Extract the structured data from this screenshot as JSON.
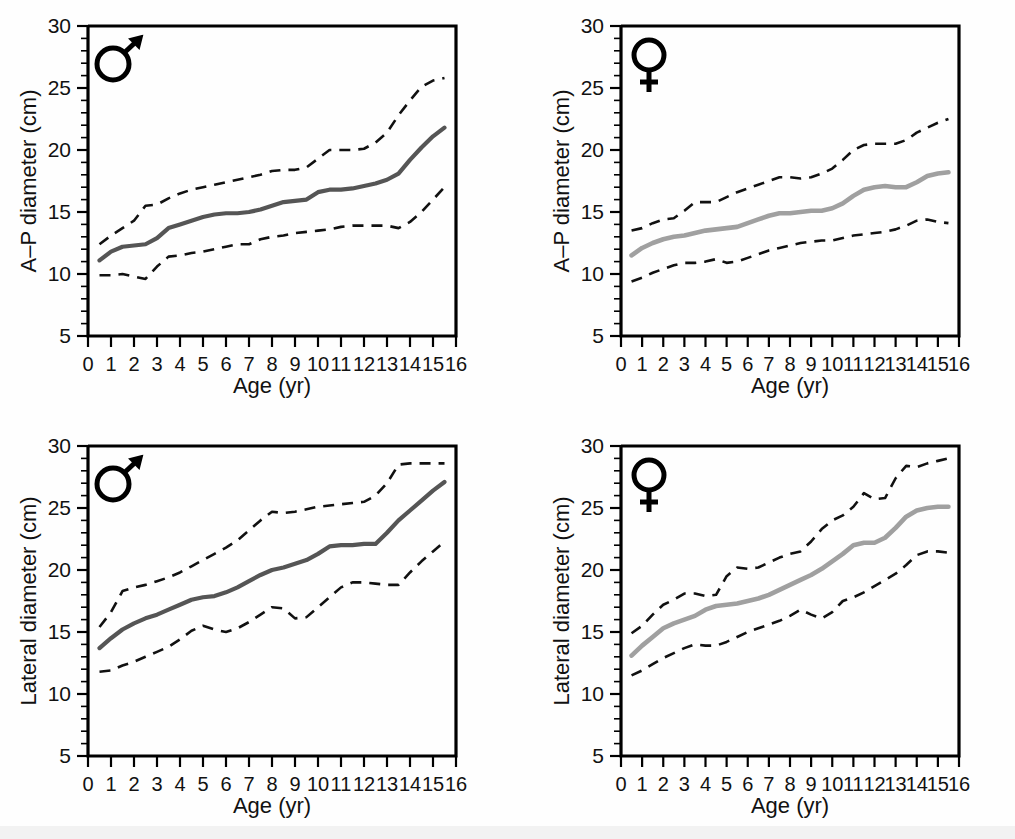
{
  "figure": {
    "name": "chest-diameter-growth-curves",
    "background": "#ffffff"
  },
  "axis": {
    "x_title": "Age (yr)",
    "x_ticks": [
      "0",
      "1",
      "2",
      "3",
      "4",
      "5",
      "6",
      "7",
      "8",
      "9",
      "10",
      "11",
      "12",
      "13",
      "14",
      "15",
      "16"
    ],
    "y_ticks": [
      "5",
      "10",
      "15",
      "20",
      "25",
      "30"
    ],
    "y_title_ap": "A–P diameter (cm)",
    "y_title_lateral": "Lateral diameter (cm)",
    "xlim": [
      0,
      16
    ],
    "ylim": [
      5,
      30
    ],
    "x_minor_step": 1,
    "y_major_step": 5,
    "y_minor_step": 1
  },
  "symbols": {
    "male": "male-symbol",
    "female": "female-symbol"
  },
  "colors": {
    "median_male": "#555555",
    "median_female": "#a0a0a0",
    "bounds": "#111111",
    "axis": "#000000"
  },
  "chart_data": [
    {
      "id": "ap-male",
      "type": "line",
      "title": "",
      "panel": "top-left",
      "sex": "male",
      "xlabel": "Age (yr)",
      "ylabel": "A–P diameter (cm)",
      "xlim": [
        0,
        16
      ],
      "ylim": [
        5,
        30
      ],
      "grid": false,
      "legend": "none",
      "x": [
        0.5,
        1,
        1.5,
        2,
        2.5,
        3,
        3.5,
        4,
        4.5,
        5,
        5.5,
        6,
        6.5,
        7,
        7.5,
        8,
        8.5,
        9,
        9.5,
        10,
        10.5,
        11,
        11.5,
        12,
        12.5,
        13,
        13.5,
        14,
        14.5,
        15,
        15.5
      ],
      "series": [
        {
          "name": "median",
          "style": "solid",
          "color": "#555555",
          "values": [
            11.1,
            11.8,
            12.2,
            12.3,
            12.4,
            12.9,
            13.7,
            14.0,
            14.3,
            14.6,
            14.8,
            14.9,
            14.9,
            15.0,
            15.2,
            15.5,
            15.8,
            15.9,
            16.0,
            16.6,
            16.8,
            16.8,
            16.9,
            17.1,
            17.3,
            17.6,
            18.1,
            19.2,
            20.2,
            21.1,
            21.8
          ]
        },
        {
          "name": "upper-bound",
          "style": "dashed",
          "color": "#111111",
          "values": [
            12.4,
            13.1,
            13.7,
            14.3,
            15.5,
            15.6,
            16.1,
            16.5,
            16.8,
            17.0,
            17.2,
            17.4,
            17.6,
            17.8,
            18.0,
            18.3,
            18.4,
            18.4,
            18.6,
            19.3,
            20.0,
            20.0,
            20.0,
            20.1,
            20.6,
            21.4,
            22.8,
            24.0,
            25.1,
            25.6,
            25.8
          ]
        },
        {
          "name": "lower-bound",
          "style": "dashed",
          "color": "#111111",
          "values": [
            9.9,
            9.9,
            10.0,
            9.8,
            9.6,
            10.6,
            11.4,
            11.5,
            11.7,
            11.8,
            12.0,
            12.2,
            12.4,
            12.4,
            12.8,
            13.0,
            13.1,
            13.3,
            13.4,
            13.5,
            13.6,
            13.8,
            13.9,
            13.9,
            13.9,
            13.9,
            13.7,
            14.2,
            15.0,
            16.0,
            17.0
          ]
        }
      ]
    },
    {
      "id": "ap-female",
      "type": "line",
      "title": "",
      "panel": "top-right",
      "sex": "female",
      "xlabel": "Age (yr)",
      "ylabel": "A–P diameter (cm)",
      "xlim": [
        0,
        16
      ],
      "ylim": [
        5,
        30
      ],
      "grid": false,
      "legend": "none",
      "x": [
        0.5,
        1,
        1.5,
        2,
        2.5,
        3,
        3.5,
        4,
        4.5,
        5,
        5.5,
        6,
        6.5,
        7,
        7.5,
        8,
        8.5,
        9,
        9.5,
        10,
        10.5,
        11,
        11.5,
        12,
        12.5,
        13,
        13.5,
        14,
        14.5,
        15,
        15.5
      ],
      "series": [
        {
          "name": "median",
          "style": "solid",
          "color": "#a0a0a0",
          "values": [
            11.5,
            12.1,
            12.5,
            12.8,
            13.0,
            13.1,
            13.3,
            13.5,
            13.6,
            13.7,
            13.8,
            14.1,
            14.4,
            14.7,
            14.9,
            14.9,
            15.0,
            15.1,
            15.1,
            15.3,
            15.7,
            16.3,
            16.8,
            17.0,
            17.1,
            17.0,
            17.0,
            17.4,
            17.9,
            18.1,
            18.2
          ]
        },
        {
          "name": "upper-bound",
          "style": "dashed",
          "color": "#111111",
          "values": [
            13.5,
            13.7,
            14.1,
            14.4,
            14.5,
            15.1,
            15.8,
            15.8,
            15.8,
            16.2,
            16.6,
            16.9,
            17.2,
            17.5,
            17.8,
            17.8,
            17.7,
            17.8,
            18.1,
            18.5,
            19.2,
            20.0,
            20.4,
            20.5,
            20.5,
            20.5,
            20.8,
            21.4,
            21.8,
            22.2,
            22.5
          ]
        },
        {
          "name": "lower-bound",
          "style": "dashed",
          "color": "#111111",
          "values": [
            9.4,
            9.7,
            10.1,
            10.4,
            10.7,
            10.9,
            10.9,
            11.0,
            11.2,
            10.9,
            11.0,
            11.3,
            11.6,
            11.9,
            12.1,
            12.3,
            12.5,
            12.6,
            12.7,
            12.7,
            12.9,
            13.1,
            13.2,
            13.3,
            13.4,
            13.6,
            13.9,
            14.3,
            14.4,
            14.2,
            14.1
          ]
        }
      ]
    },
    {
      "id": "lateral-male",
      "type": "line",
      "title": "",
      "panel": "bottom-left",
      "sex": "male",
      "xlabel": "Age (yr)",
      "ylabel": "Lateral diameter (cm)",
      "xlim": [
        0,
        16
      ],
      "ylim": [
        5,
        30
      ],
      "grid": false,
      "legend": "none",
      "x": [
        0.5,
        1,
        1.5,
        2,
        2.5,
        3,
        3.5,
        4,
        4.5,
        5,
        5.5,
        6,
        6.5,
        7,
        7.5,
        8,
        8.5,
        9,
        9.5,
        10,
        10.5,
        11,
        11.5,
        12,
        12.5,
        13,
        13.5,
        14,
        14.5,
        15,
        15.5
      ],
      "series": [
        {
          "name": "median",
          "style": "solid",
          "color": "#555555",
          "values": [
            13.7,
            14.5,
            15.2,
            15.7,
            16.1,
            16.4,
            16.8,
            17.2,
            17.6,
            17.8,
            17.9,
            18.2,
            18.6,
            19.1,
            19.6,
            20.0,
            20.2,
            20.5,
            20.8,
            21.3,
            21.9,
            22.0,
            22.0,
            22.1,
            22.1,
            23.0,
            24.0,
            24.8,
            25.6,
            26.4,
            27.1
          ]
        },
        {
          "name": "upper-bound",
          "style": "dashed",
          "color": "#111111",
          "values": [
            15.4,
            16.6,
            18.3,
            18.6,
            18.8,
            19.1,
            19.4,
            19.8,
            20.3,
            20.8,
            21.3,
            21.8,
            22.4,
            23.2,
            24.0,
            24.7,
            24.6,
            24.7,
            24.9,
            25.1,
            25.2,
            25.3,
            25.4,
            25.5,
            26.0,
            27.0,
            28.5,
            28.6,
            28.6,
            28.6,
            28.6
          ]
        },
        {
          "name": "lower-bound",
          "style": "dashed",
          "color": "#111111",
          "values": [
            11.8,
            11.9,
            12.3,
            12.6,
            13.0,
            13.4,
            13.8,
            14.4,
            15.1,
            15.5,
            15.2,
            15.0,
            15.3,
            15.8,
            16.4,
            17.0,
            16.9,
            16.1,
            16.2,
            17.0,
            17.8,
            18.6,
            19.0,
            19.0,
            18.9,
            18.8,
            18.8,
            19.8,
            20.7,
            21.5,
            22.3
          ]
        }
      ]
    },
    {
      "id": "lateral-female",
      "type": "line",
      "title": "",
      "panel": "bottom-right",
      "sex": "female",
      "xlabel": "Age (yr)",
      "ylabel": "Lateral diameter (cm)",
      "xlim": [
        0,
        16
      ],
      "ylim": [
        5,
        30
      ],
      "grid": false,
      "legend": "none",
      "x": [
        0.5,
        1,
        1.5,
        2,
        2.5,
        3,
        3.5,
        4,
        4.5,
        5,
        5.5,
        6,
        6.5,
        7,
        7.5,
        8,
        8.5,
        9,
        9.5,
        10,
        10.5,
        11,
        11.5,
        12,
        12.5,
        13,
        13.5,
        14,
        14.5,
        15,
        15.5
      ],
      "series": [
        {
          "name": "median",
          "style": "solid",
          "color": "#a0a0a0",
          "values": [
            13.1,
            13.9,
            14.6,
            15.3,
            15.7,
            16.0,
            16.3,
            16.8,
            17.1,
            17.2,
            17.3,
            17.5,
            17.7,
            18.0,
            18.4,
            18.8,
            19.2,
            19.6,
            20.1,
            20.7,
            21.3,
            22.0,
            22.2,
            22.2,
            22.6,
            23.4,
            24.3,
            24.8,
            25.0,
            25.1,
            25.1
          ]
        },
        {
          "name": "upper-bound",
          "style": "dashed",
          "color": "#111111",
          "values": [
            14.9,
            15.5,
            16.4,
            17.2,
            17.6,
            18.1,
            18.1,
            17.9,
            18.0,
            19.5,
            20.2,
            20.1,
            20.2,
            20.6,
            21.0,
            21.3,
            21.5,
            22.3,
            23.3,
            24.0,
            24.4,
            25.1,
            26.2,
            25.7,
            25.8,
            27.4,
            28.4,
            28.3,
            28.6,
            28.8,
            29.0
          ]
        },
        {
          "name": "lower-bound",
          "style": "dashed",
          "color": "#111111",
          "values": [
            11.5,
            11.9,
            12.4,
            12.9,
            13.3,
            13.7,
            14.0,
            13.9,
            13.9,
            14.2,
            14.6,
            15.0,
            15.3,
            15.6,
            15.9,
            16.3,
            16.8,
            16.4,
            16.1,
            16.6,
            17.5,
            17.8,
            18.2,
            18.7,
            19.2,
            19.7,
            20.4,
            21.2,
            21.5,
            21.5,
            21.4
          ]
        }
      ]
    }
  ]
}
